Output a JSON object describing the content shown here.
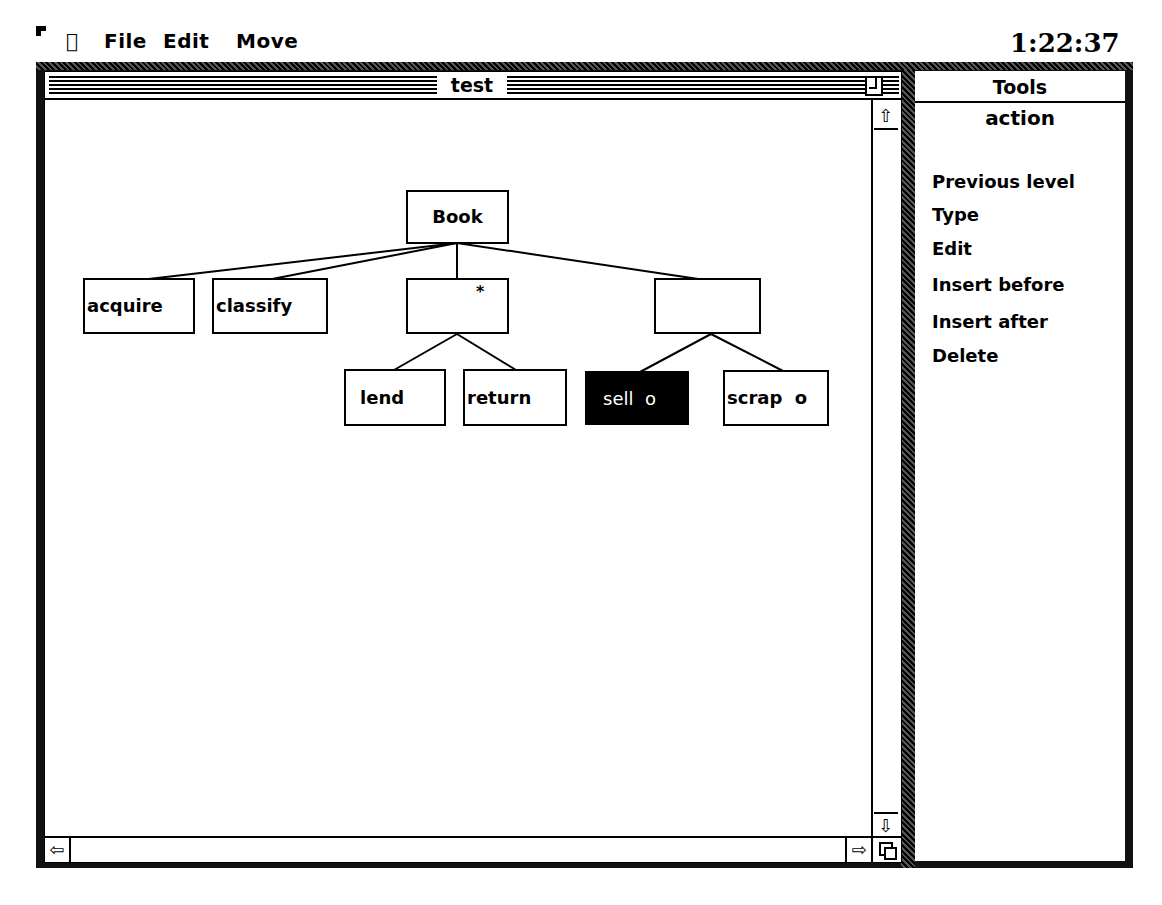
{
  "menubar": {
    "apple_icon": "",
    "items": [
      "File",
      "Edit",
      "Move"
    ],
    "clock": "1:22:37"
  },
  "window": {
    "title": "test"
  },
  "tree": {
    "root": {
      "label": "Book"
    },
    "level1": [
      {
        "label": "acquire"
      },
      {
        "label": "classify"
      },
      {
        "label": "*",
        "note": "iteration marker"
      },
      {
        "label": ""
      }
    ],
    "level2": [
      {
        "label": "lend"
      },
      {
        "label": "return"
      },
      {
        "label": "sell  o",
        "selected": true
      },
      {
        "label": "scrap  o"
      }
    ]
  },
  "tools": {
    "title": "Tools",
    "subtitle": "action",
    "items": [
      "Previous level",
      "Type",
      "Edit",
      "Insert before",
      "Insert after",
      "Delete"
    ]
  },
  "colors": {
    "background": "#ffffff",
    "foreground": "#000000"
  }
}
